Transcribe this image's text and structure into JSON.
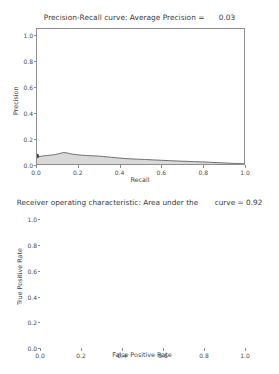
{
  "figure": {
    "width": 279,
    "height": 374,
    "background": "#ffffff"
  },
  "chart_data": [
    {
      "type": "line",
      "id": "precision-recall",
      "title": "Precision-Recall curve: Average Precision =      0.03",
      "title_text": "Precision-Recall curve: Average Precision =",
      "average_precision": "0.03",
      "xlabel": "Recall",
      "ylabel": "Precision",
      "xlim": [
        0.0,
        1.0
      ],
      "ylim": [
        0.0,
        1.05
      ],
      "xticks": [
        "0.0",
        "0.2",
        "0.4",
        "0.6",
        "0.8",
        "1.0"
      ],
      "xtick_values": [
        0.0,
        0.2,
        0.4,
        0.6,
        0.8,
        1.0
      ],
      "yticks": [
        "0.0",
        "0.2",
        "0.4",
        "0.6",
        "0.8",
        "1.0"
      ],
      "ytick_values": [
        0.0,
        0.2,
        0.4,
        0.6,
        0.8,
        1.0
      ],
      "grid": false,
      "legend": null,
      "line_color": "#6e6e6e",
      "fill_color": "#d9d9d9",
      "fill_between": true,
      "x": [
        0.0,
        0.01,
        0.02,
        0.03,
        0.04,
        0.05,
        0.06,
        0.07,
        0.08,
        0.09,
        0.1,
        0.11,
        0.12,
        0.13,
        0.14,
        0.15,
        0.16,
        0.17,
        0.18,
        0.19,
        0.2,
        0.22,
        0.24,
        0.26,
        0.28,
        0.3,
        0.32,
        0.34,
        0.36,
        0.38,
        0.4,
        0.44,
        0.48,
        0.52,
        0.56,
        0.6,
        0.64,
        0.68,
        0.72,
        0.76,
        0.8,
        0.84,
        0.88,
        0.92,
        0.96,
        1.0
      ],
      "y": [
        0.062,
        0.058,
        0.06,
        0.063,
        0.065,
        0.066,
        0.068,
        0.07,
        0.072,
        0.074,
        0.078,
        0.082,
        0.086,
        0.089,
        0.087,
        0.084,
        0.08,
        0.077,
        0.075,
        0.073,
        0.071,
        0.068,
        0.066,
        0.064,
        0.063,
        0.061,
        0.058,
        0.055,
        0.052,
        0.049,
        0.046,
        0.041,
        0.038,
        0.035,
        0.032,
        0.029,
        0.026,
        0.023,
        0.021,
        0.018,
        0.016,
        0.013,
        0.01,
        0.007,
        0.004,
        0.001
      ],
      "start_marker": {
        "x": 0.0,
        "y": 0.062,
        "color": "#4a4a4a"
      }
    },
    {
      "type": "line",
      "id": "roc-curve",
      "title": "Receiver operating characteristic: Area under the       curve = 0.92",
      "title_text": "Receiver operating characteristic: Area under the",
      "auc_text": "curve = 0.92",
      "area_under_curve": "0.92",
      "xlabel": "False Positive Rate",
      "ylabel": "True Positive Rate",
      "xlim": [
        0.0,
        1.0
      ],
      "ylim": [
        0.0,
        1.05
      ],
      "xticks": [
        "0.0",
        "0.2",
        "0.4",
        "0.6",
        "0.8",
        "1.0"
      ],
      "xtick_values": [
        0.0,
        0.2,
        0.4,
        0.6,
        0.8,
        1.0
      ],
      "yticks": [
        "0.0",
        "0.2",
        "0.4",
        "0.6",
        "0.8",
        "1.0"
      ],
      "ytick_values": [
        0.0,
        0.2,
        0.4,
        0.6,
        0.8,
        1.0
      ],
      "grid": false,
      "legend": {
        "position": "lower right",
        "entries": [
          "ROC curve"
        ]
      },
      "legend_label": "ROC curve",
      "line_color": "#b0b0b0",
      "diagonal": {
        "style": "dashed",
        "color": "#222222",
        "from": [
          0.0,
          0.0
        ],
        "to": [
          1.0,
          1.0
        ]
      },
      "series": [
        {
          "name": "ROC curve",
          "x": [
            0.0,
            0.002,
            0.005,
            0.008,
            0.012,
            0.016,
            0.02,
            0.025,
            0.03,
            0.035,
            0.04,
            0.045,
            0.05,
            0.055,
            0.06,
            0.065,
            0.07,
            0.075,
            0.08,
            0.085,
            0.09,
            0.095,
            0.1,
            0.105,
            0.11,
            0.115,
            0.12,
            0.125,
            0.13,
            0.14,
            0.16,
            0.18,
            0.2,
            0.24,
            0.28,
            0.32,
            0.36,
            0.4,
            0.44,
            0.48,
            0.52,
            0.56,
            0.6,
            0.64,
            0.68,
            0.72,
            0.76,
            0.79,
            0.8,
            0.83,
            0.86,
            0.89,
            0.92,
            0.95,
            0.98,
            1.0
          ],
          "y": [
            0.0,
            0.12,
            0.23,
            0.28,
            0.33,
            0.38,
            0.42,
            0.47,
            0.51,
            0.545,
            0.58,
            0.61,
            0.64,
            0.665,
            0.69,
            0.715,
            0.74,
            0.762,
            0.785,
            0.805,
            0.825,
            0.845,
            0.86,
            0.872,
            0.882,
            0.89,
            0.898,
            0.905,
            0.91,
            0.912,
            0.914,
            0.916,
            0.918,
            0.921,
            0.924,
            0.927,
            0.93,
            0.933,
            0.936,
            0.939,
            0.942,
            0.945,
            0.948,
            0.951,
            0.954,
            0.957,
            0.96,
            0.963,
            0.975,
            0.98,
            0.984,
            0.988,
            0.992,
            0.996,
            0.999,
            1.0
          ]
        }
      ]
    }
  ]
}
